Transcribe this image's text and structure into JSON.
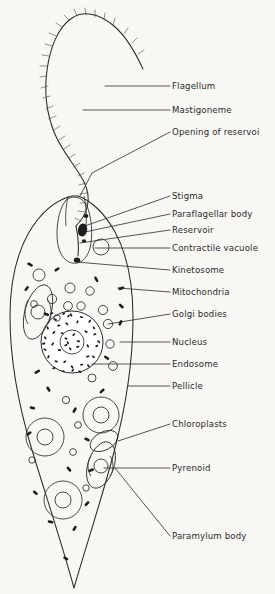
{
  "figure": {
    "organism": "Euglena",
    "view": "longitudinal section",
    "background_color": "#f8f7f4",
    "ink_color": "#2b2b2b"
  },
  "labels": [
    {
      "id": "flagellum",
      "text": "Flagellum",
      "x": 172,
      "y": 86,
      "leader": "M170,86 L105,86"
    },
    {
      "id": "mastigoneme",
      "text": "Mastigoneme",
      "x": 172,
      "y": 110,
      "leader": "M170,110 L83,110"
    },
    {
      "id": "opening-of-reservoir",
      "text": "Opening of reservoi",
      "x": 172,
      "y": 132,
      "leader": "M170,132 L92,173 L80,196"
    },
    {
      "id": "stigma",
      "text": "Stigma",
      "x": 172,
      "y": 196,
      "leader": "M170,196 L82,227"
    },
    {
      "id": "paraflagellar-body",
      "text": "Paraflagellar body",
      "x": 172,
      "y": 214,
      "leader": "M170,214 L85,232"
    },
    {
      "id": "reservoir",
      "text": "Reservoir",
      "x": 172,
      "y": 230,
      "leader": "M170,230 L80,243"
    },
    {
      "id": "contractile-vacuole",
      "text": "Contractile vacuole",
      "x": 172,
      "y": 248,
      "leader": "M170,248 L95,248"
    },
    {
      "id": "kinetosome",
      "text": "Kinetosome",
      "x": 172,
      "y": 270,
      "leader": "M170,270 L76,262"
    },
    {
      "id": "mitochondria",
      "text": "Mitochondria",
      "x": 172,
      "y": 292,
      "leader": "M170,292 L118,288"
    },
    {
      "id": "golgi-bodies",
      "text": "Golgi bodies",
      "x": 172,
      "y": 314,
      "leader": "M170,314 L108,324"
    },
    {
      "id": "nucleus",
      "text": "Nucleus",
      "x": 172,
      "y": 342,
      "leader": "M170,342 L120,342"
    },
    {
      "id": "endosome",
      "text": "Endosome",
      "x": 172,
      "y": 364,
      "leader": "M170,364 L92,364"
    },
    {
      "id": "pellicle",
      "text": "Pellicle",
      "x": 172,
      "y": 386,
      "leader": "M170,386 L128,386"
    },
    {
      "id": "chloroplasts",
      "text": "Chloroplasts",
      "x": 172,
      "y": 424,
      "leader": "M170,424 L118,441"
    },
    {
      "id": "pyrenoid",
      "text": "Pyrenoid",
      "x": 172,
      "y": 468,
      "leader": "M170,468 L104,468"
    },
    {
      "id": "paramylum-body",
      "text": "Paramylum body",
      "x": 172,
      "y": 536,
      "leader": "M170,536 L115,468"
    }
  ],
  "structures": {
    "flagellum": {
      "name": "flagellum",
      "description": "long whip-like undulating filament fringed with mastigonemes"
    },
    "mastigonemes": {
      "name": "mastigonemes",
      "description": "fine lateral hairs on the flagellum"
    },
    "reservoir": {
      "name": "reservoir",
      "description": "flask-shaped cavity at the anterior end"
    },
    "stigma": {
      "name": "stigma",
      "description": "dark red eyespot beside the reservoir"
    },
    "paraflagellar_body": {
      "name": "paraflagellar-body",
      "description": "swelling on the flagellum near the stigma"
    },
    "contractile_vacuole": {
      "name": "contractile-vacuole",
      "description": "open circle adjacent to the reservoir"
    },
    "kinetosome": {
      "name": "kinetosome",
      "description": "basal body at flagellar base"
    },
    "mitochondria": {
      "name": "mitochondria",
      "description": "small dark rod-shaped bodies scattered in cytoplasm",
      "count": 18
    },
    "golgi_bodies": {
      "name": "golgi-bodies",
      "description": "small open circles in cytoplasm",
      "count": 16
    },
    "nucleus": {
      "name": "nucleus",
      "description": "large stippled spherical body in mid-cell"
    },
    "endosome": {
      "name": "endosome",
      "description": "dense nucleolus at the centre of the nucleus"
    },
    "pellicle": {
      "name": "pellicle",
      "description": "outer striated body covering / cell boundary"
    },
    "chloroplasts": {
      "name": "chloroplasts",
      "description": "oval plastids each containing a pyrenoid",
      "count": 5
    },
    "pyrenoid": {
      "name": "pyrenoid",
      "description": "concentric ring body inside a chloroplast"
    },
    "paramylum_body": {
      "name": "paramylum-body",
      "description": "storage granule near the chloroplast"
    }
  }
}
